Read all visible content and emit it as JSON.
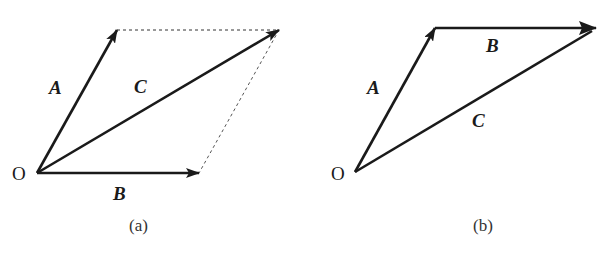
{
  "diagram": {
    "panels": [
      {
        "id": "a",
        "caption": "(a)",
        "origin_label": "O",
        "vectors": [
          {
            "name": "A",
            "from": [
              37,
              173
            ],
            "to": [
              117,
              30
            ]
          },
          {
            "name": "B",
            "from": [
              37,
              173
            ],
            "to": [
              199,
              173
            ]
          },
          {
            "name": "C",
            "from": [
              37,
              173
            ],
            "to": [
              279,
              30
            ]
          }
        ],
        "dashed_lines": [
          {
            "from": [
              117,
              30
            ],
            "to": [
              279,
              30
            ]
          },
          {
            "from": [
              279,
              30
            ],
            "to": [
              199,
              173
            ]
          }
        ]
      },
      {
        "id": "b",
        "caption": "(b)",
        "origin_label": "O",
        "vectors": [
          {
            "name": "A",
            "from": [
              355,
              172
            ],
            "to": [
              435,
              28
            ]
          },
          {
            "name": "B",
            "from": [
              435,
              28
            ],
            "to": [
              596,
              28
            ]
          },
          {
            "name": "C",
            "from": [
              355,
              172
            ],
            "to": [
              596,
              28
            ]
          }
        ]
      }
    ],
    "line_color": "#1a1a1a"
  }
}
